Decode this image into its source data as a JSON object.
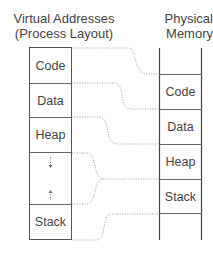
{
  "diagram": {
    "virtual": {
      "title_line1": "Virtual Addresses",
      "title_line2": "(Process Layout)",
      "segments": [
        {
          "label": "Code",
          "top": 0,
          "height": 36
        },
        {
          "label": "Data",
          "top": 36,
          "height": 34
        },
        {
          "label": "Heap",
          "top": 70,
          "height": 35
        },
        {
          "label": "",
          "top": 105,
          "height": 52,
          "note": "free space (heap grows down, stack grows up)"
        },
        {
          "label": "Stack",
          "top": 157,
          "height": 36
        }
      ]
    },
    "physical": {
      "title_line1": "Physical",
      "title_line2": "Memory",
      "segments": [
        {
          "label": "Code",
          "top": 74,
          "height": 35
        },
        {
          "label": "Data",
          "top": 109,
          "height": 35
        },
        {
          "label": "Heap",
          "top": 144,
          "height": 35
        },
        {
          "label": "Stack",
          "top": 179,
          "height": 35
        }
      ]
    },
    "mappings": [
      {
        "from": "Code",
        "to": "Code"
      },
      {
        "from": "Data",
        "to": "Data"
      },
      {
        "from": "Heap",
        "to": "Heap"
      },
      {
        "from": "Free space",
        "to": "Heap/Stack boundary"
      },
      {
        "from": "Stack",
        "to": "Stack"
      }
    ],
    "colors": {
      "text": "#444444",
      "border": "#555555",
      "connector": "#999999"
    }
  }
}
